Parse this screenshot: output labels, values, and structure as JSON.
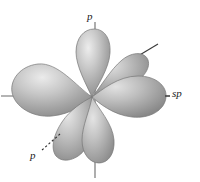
{
  "figure": {
    "name": "sp-hybrid-orbital-diagram",
    "width": 200,
    "height": 182,
    "background_color": "#ffffff"
  },
  "colors": {
    "lobe_light": "#e8e8e8",
    "lobe_mid": "#b4b4b4",
    "lobe_dark": "#8a8a8a",
    "lobe_edge": "#6f6f6f",
    "axis_line": "#6b6b6b",
    "leader_line": "#2b2b2b",
    "label_text": "#1a1a1a"
  },
  "labels": [
    {
      "id": "p-top",
      "text": "p",
      "style": "italic",
      "position": "top",
      "leader": "solid-vertical"
    },
    {
      "id": "sp-right",
      "text": "sp",
      "style": "italic",
      "position": "right",
      "leader": "solid-horizontal"
    },
    {
      "id": "p-lower-left",
      "text": "p",
      "style": "italic",
      "position": "lower-left",
      "leader": "dashed-diagonal"
    }
  ],
  "label_text": {
    "p_top": "p",
    "sp_right": "sp",
    "p_lower_left": "p"
  },
  "lobes": [
    {
      "id": "lobe-p-up",
      "orbital": "p",
      "direction": "up",
      "labelled": true
    },
    {
      "id": "lobe-p-down",
      "orbital": "p",
      "direction": "down",
      "labelled": false
    },
    {
      "id": "lobe-sp-right",
      "orbital": "sp",
      "direction": "right",
      "labelled": true
    },
    {
      "id": "lobe-sp-left",
      "orbital": "sp",
      "direction": "left",
      "labelled": false
    },
    {
      "id": "lobe-p-upper-right",
      "orbital": "p",
      "direction": "upper-right",
      "labelled": false
    },
    {
      "id": "lobe-p-lower-left",
      "orbital": "p",
      "direction": "lower-left",
      "labelled": true
    }
  ],
  "axes": [
    {
      "id": "axis-vertical",
      "orientation": "vertical",
      "style": "solid"
    },
    {
      "id": "axis-horizontal",
      "orientation": "horizontal",
      "style": "solid"
    },
    {
      "id": "axis-diagonal",
      "orientation": "diagonal",
      "style": "solid"
    }
  ]
}
